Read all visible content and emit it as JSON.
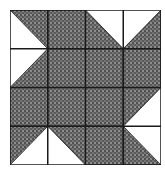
{
  "diagram": {
    "type": "quilt-block",
    "rows": 4,
    "cols": 4,
    "shade_color": "#3a3a3a",
    "background_color": "#ffffff",
    "line_color": "#1a1a1a",
    "cells": [
      [
        "ll",
        "full",
        "ur",
        "ul"
      ],
      [
        "ul",
        "full",
        "full",
        "full"
      ],
      [
        "full",
        "full",
        "full",
        "lr"
      ],
      [
        "lr",
        "ll",
        "full",
        "ur"
      ]
    ],
    "legend": {
      "full": "fully shaded square",
      "ul": "half-square triangle, white upper-left",
      "ur": "half-square triangle, white upper-right",
      "ll": "half-square triangle, white lower-left",
      "lr": "half-square triangle, white lower-right"
    }
  }
}
